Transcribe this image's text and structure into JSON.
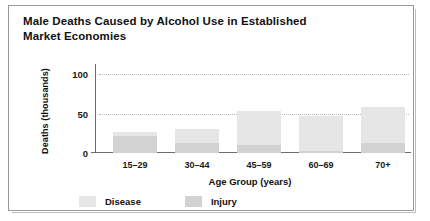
{
  "figure": {
    "title_line1": "Male Deaths Caused by Alcohol Use in Established",
    "title_line2": "Market Economies"
  },
  "legend": {
    "items": [
      {
        "label": "Disease",
        "color": "#e6e6e6",
        "swatch_name": "legend-swatch-disease"
      },
      {
        "label": "Injury",
        "color": "#d2d2d2",
        "swatch_name": "legend-swatch-injury"
      }
    ]
  },
  "chart_data": {
    "type": "bar",
    "stacked": true,
    "title": "Male Deaths Caused by Alcohol Use in Established Market Economies",
    "xlabel": "Age Group (years)",
    "ylabel": "Deaths (thousands)",
    "categories": [
      "15–29",
      "30–44",
      "45–59",
      "60–69",
      "70+"
    ],
    "series": [
      {
        "name": "Disease",
        "color": "#e6e6e6",
        "values": [
          5,
          17,
          43,
          44,
          45
        ]
      },
      {
        "name": "Injury",
        "color": "#d2d2d2",
        "values": [
          22,
          13,
          10,
          3,
          13
        ]
      }
    ],
    "totals": [
      27,
      30,
      53,
      47,
      58
    ],
    "ylim": [
      0,
      108
    ],
    "yticks": [
      0,
      50,
      100
    ],
    "ytick_labels": [
      "0",
      "50",
      "100"
    ],
    "grid": "horizontal-dotted",
    "legend_position": "bottom"
  }
}
